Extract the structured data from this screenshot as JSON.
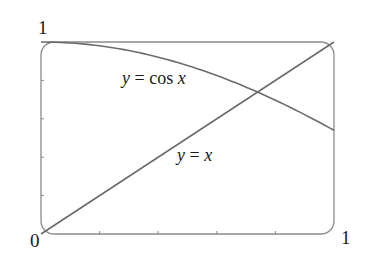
{
  "chart_data": {
    "type": "line",
    "title": "",
    "xlabel": "",
    "ylabel": "",
    "xlim": [
      0,
      1
    ],
    "ylim": [
      0,
      1
    ],
    "grid": false,
    "legend": "none",
    "x_tick_labels": [
      {
        "value": 0,
        "label": "0"
      },
      {
        "value": 1,
        "label": "1"
      }
    ],
    "y_tick_labels": [
      {
        "value": 1,
        "label": "1"
      }
    ],
    "x_minor_ticks": [
      0.2,
      0.4,
      0.6,
      0.8
    ],
    "y_minor_ticks": [
      0.2,
      0.4,
      0.6,
      0.8
    ],
    "series": [
      {
        "name": "y = cos x",
        "function": "cos(x)",
        "x": [
          0,
          0.1,
          0.2,
          0.3,
          0.4,
          0.5,
          0.6,
          0.7,
          0.8,
          0.9,
          1.0
        ],
        "values": [
          1.0,
          0.995,
          0.98,
          0.955,
          0.921,
          0.878,
          0.825,
          0.765,
          0.697,
          0.622,
          0.54
        ]
      },
      {
        "name": "y = x",
        "function": "x",
        "x": [
          0,
          1
        ],
        "values": [
          0,
          1
        ]
      }
    ],
    "annotations": [
      {
        "text": "y = cos x",
        "x": 0.28,
        "y": 0.79
      },
      {
        "text": "y = x",
        "x": 0.47,
        "y": 0.39
      }
    ],
    "intersection": {
      "x": 0.739,
      "y": 0.739
    }
  },
  "labels": {
    "origin": "0",
    "x_max": "1",
    "y_max": "1",
    "cos_label_y": "y",
    "cos_label_eq": " = ",
    "cos_label_fn": "cos",
    "cos_label_x": " x",
    "line_label_y": "y",
    "line_label_eq": " = ",
    "line_label_x": "x"
  },
  "colors": {
    "curve": "#6b6b6b",
    "frame": "#8a8a8a",
    "text": "#1a1a1a"
  }
}
